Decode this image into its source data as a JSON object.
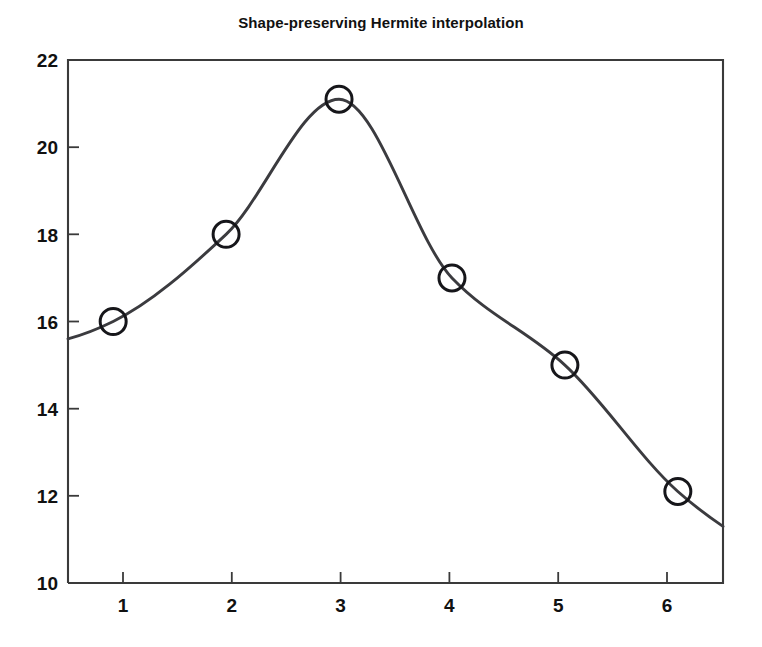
{
  "chart_data": {
    "type": "line",
    "title": "Shape-preserving Hermite interpolation",
    "subtitle": "",
    "xlabel": "",
    "ylabel": "",
    "x": [
      1,
      2,
      3,
      4,
      5,
      6
    ],
    "values": [
      16.0,
      18.0,
      21.1,
      17.0,
      15.0,
      12.1
    ],
    "series": [
      {
        "name": "pchip",
        "x": [
          1,
          2,
          3,
          4,
          5,
          6
        ],
        "values": [
          16.0,
          18.0,
          21.1,
          17.0,
          15.0,
          12.1
        ]
      }
    ],
    "marker": "open-circle",
    "line_style": "solid",
    "xlim": [
      0.6,
      6.4
    ],
    "ylim": [
      10,
      22
    ],
    "xticks": [
      1,
      2,
      3,
      4,
      5,
      6
    ],
    "yticks": [
      10,
      12,
      14,
      16,
      18,
      20,
      22
    ],
    "xtick_labels": [
      "1",
      "2",
      "3",
      "4",
      "5",
      "6"
    ],
    "ytick_labels": [
      "10",
      "12",
      "14",
      "16",
      "18",
      "20",
      "22"
    ],
    "grid": false,
    "legend": null,
    "legend_position": "none",
    "curve_extends_beyond_data": true,
    "curve_left_endpoint": [
      0.6,
      15.6
    ],
    "curve_right_endpoint": [
      6.4,
      11.3
    ],
    "line_color": "#3b3b3f",
    "marker_color": "#16161a",
    "axis_color": "#3a3a3a",
    "background_color": "#ffffff",
    "text_color": "#111111"
  }
}
